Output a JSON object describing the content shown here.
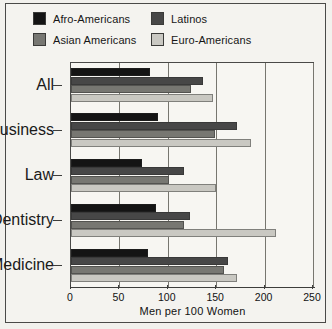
{
  "chart_data": {
    "type": "bar",
    "orientation": "horizontal",
    "title": "",
    "xlabel": "Men per 100 Women",
    "ylabel": "",
    "xlim": [
      0,
      250
    ],
    "xticks": [
      0,
      50,
      100,
      150,
      200,
      250
    ],
    "grid": true,
    "grid_axis": "x",
    "legend_position": "top",
    "categories": [
      "All",
      "Business",
      "Law",
      "Dentistry",
      "Medicine"
    ],
    "series": [
      {
        "name": "Afro-Americans",
        "color": "#141414",
        "values": [
          82,
          90,
          73,
          88,
          80
        ]
      },
      {
        "name": "Latinos",
        "color": "#474747",
        "values": [
          136,
          172,
          117,
          123,
          162
        ]
      },
      {
        "name": "Asian Americans",
        "color": "#777772",
        "values": [
          124,
          149,
          101,
          117,
          158
        ]
      },
      {
        "name": "Euro-Americans",
        "color": "#c9c8c2",
        "values": [
          147,
          186,
          150,
          212,
          172
        ]
      }
    ]
  },
  "legend": {
    "entries": [
      {
        "label": "Afro-Americans",
        "color": "#141414"
      },
      {
        "label": "Latinos",
        "color": "#474747"
      },
      {
        "label": "Asian Americans",
        "color": "#777772"
      },
      {
        "label": "Euro-Americans",
        "color": "#c9c8c2"
      }
    ]
  },
  "axis": {
    "x_tick_labels": [
      "0",
      "50",
      "100",
      "150",
      "200",
      "250"
    ],
    "x_axis_title": "Men per 100 Women",
    "y_tick_labels": [
      "All",
      "Business",
      "Law",
      "Dentistry",
      "Medicine"
    ]
  },
  "colors": {
    "background": "#f4f3ef",
    "frame": "#4a4a48",
    "gridline": "#77766f",
    "text": "#121212"
  }
}
